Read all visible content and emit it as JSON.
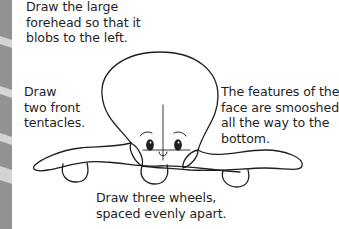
{
  "captions": {
    "forehead": [
      "Draw the large",
      "forehead so that it",
      "blobs to the left."
    ],
    "tentacles": [
      "Draw",
      "two front",
      "tentacles."
    ],
    "features": [
      "The features of the",
      "face are smooshed",
      "all the way to the",
      "bottom."
    ],
    "wheels": [
      "Draw three wheels,",
      "spaced evenly apart."
    ]
  },
  "colors": {
    "ink": "#1f1f1f",
    "strip": "#8a8a8a",
    "background": "#ffffff"
  }
}
